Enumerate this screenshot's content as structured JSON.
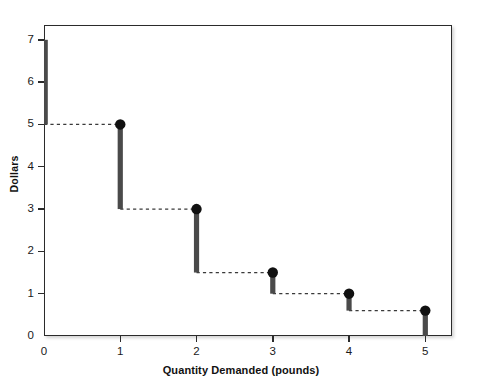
{
  "chart_data": {
    "type": "bar",
    "title": "",
    "subtitle": "",
    "xlabel": "Quantity Demanded (pounds)",
    "ylabel": "Dollars",
    "xlim": [
      0,
      5.35
    ],
    "ylim": [
      0,
      7.35
    ],
    "grid": false,
    "legend": null,
    "x_ticks": [
      "0",
      "1",
      "2",
      "3",
      "4",
      "5"
    ],
    "x_tick_values": [
      0,
      1,
      2,
      3,
      4,
      5
    ],
    "y_ticks": [
      "0",
      "1",
      "2",
      "3",
      "4",
      "5",
      "6",
      "7"
    ],
    "y_tick_values": [
      0,
      1,
      2,
      3,
      4,
      5,
      6,
      7
    ],
    "categories": [
      0,
      1,
      2,
      3,
      4,
      5
    ],
    "values": [
      7,
      5,
      3,
      1.5,
      1,
      0.6
    ],
    "series": [
      {
        "name": "Willingness to pay",
        "points": [
          {
            "x": 1,
            "y": 5
          },
          {
            "x": 2,
            "y": 3
          },
          {
            "x": 3,
            "y": 1.5
          },
          {
            "x": 4,
            "y": 1
          },
          {
            "x": 5,
            "y": 0.6
          }
        ]
      }
    ],
    "bars": [
      {
        "x": 0,
        "y_top": 7,
        "y_bottom": 5,
        "has_marker": false
      },
      {
        "x": 1,
        "y_top": 5,
        "y_bottom": 3,
        "has_marker": true
      },
      {
        "x": 2,
        "y_top": 3,
        "y_bottom": 1.5,
        "has_marker": true
      },
      {
        "x": 3,
        "y_top": 1.5,
        "y_bottom": 1,
        "has_marker": true
      },
      {
        "x": 4,
        "y_top": 1,
        "y_bottom": 0.6,
        "has_marker": true
      },
      {
        "x": 5,
        "y_top": 0.6,
        "y_bottom": 0,
        "has_marker": true
      }
    ],
    "dashed_connectors": [
      {
        "x_start": 0,
        "x_end": 1,
        "y": 5
      },
      {
        "x_start": 1,
        "x_end": 2,
        "y": 3
      },
      {
        "x_start": 2,
        "x_end": 3,
        "y": 1.5
      },
      {
        "x_start": 3,
        "x_end": 4,
        "y": 1
      },
      {
        "x_start": 4,
        "x_end": 5,
        "y": 0.6
      }
    ],
    "colors": {
      "bar": "#4a4a4a",
      "marker": "#111111",
      "dash": "#3a3a3a",
      "axis": "#2b2b2b",
      "background": "#ffffff",
      "text": "#111111"
    }
  }
}
